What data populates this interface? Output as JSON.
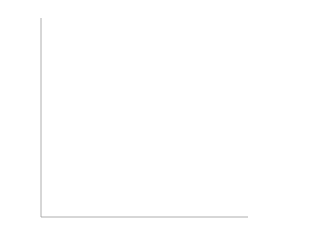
{
  "chart_data": [
    {
      "type": "bar",
      "orientation": "horizontal",
      "title": "",
      "xlabel": "",
      "ylabel": "",
      "xlim": [
        0,
        120
      ],
      "x_ticks": [
        0,
        10,
        20,
        30,
        40,
        50,
        60,
        70,
        80,
        90,
        100,
        110,
        120
      ],
      "grid": false,
      "categories": [
        "33FF33",
        "99CC00",
        "CCFF33",
        "00CC00",
        "0099FF",
        "33CCFF",
        "FFCC66",
        "006600",
        "FFCCCC",
        "33FF00",
        "CCFF00",
        "FFCC00",
        "FF0033",
        "339900",
        "00FF33",
        "FF3333",
        "00CCFF",
        "009900",
        "66FF00",
        "99FF33",
        "33CC00",
        "00FF00",
        "66CC00",
        "99FF00",
        "FF9900",
        "FF6600",
        "FF0000",
        "FF3300",
        "FFFF33",
        "FFFF00"
      ],
      "values": [
        11,
        12,
        12,
        13,
        14,
        15,
        15,
        16,
        16,
        17,
        17,
        17,
        18,
        18,
        19,
        19,
        19,
        20,
        20,
        21,
        22,
        23,
        23,
        24,
        28,
        28,
        28,
        30,
        31,
        79
      ],
      "bar_grays": [
        "#9a9a9a",
        "#9c9c9c",
        "#b4b4b4",
        "#8c8c8c",
        "#6e6e6e",
        "#a8a8a8",
        "#b8b8b8",
        "#3a3a3a",
        "#cfcfcf",
        "#a0a0a0",
        "#bcbcbc",
        "#b0b0b0",
        "#404040",
        "#6a6a6a",
        "#929292",
        "#5a5a5a",
        "#8a8a8a",
        "#6c6c6c",
        "#aaaaaa",
        "#b6b6b6",
        "#909090",
        "#9e9e9e",
        "#8e8e8e",
        "#a6a6a6",
        "#707070",
        "#5c5c5c",
        "#3e3e3e",
        "#4a4a4a",
        "#e4e4e4",
        "#e0e0e0"
      ]
    },
    {
      "type": "pie",
      "title": "",
      "legend_position": "right",
      "labels": [
        "79",
        "31",
        "30",
        "28",
        "28",
        "28",
        "24",
        "23",
        "23",
        "22"
      ],
      "values": [
        79,
        31,
        30,
        28,
        28,
        28,
        24,
        23,
        23,
        22
      ],
      "colors": [
        "#e0e0e0",
        "#e4e4e4",
        "#4a4a4a",
        "#3e3e3e",
        "#5c5c5c",
        "#707070",
        "#a6a6a6",
        "#8e8e8e",
        "#9e9e9e",
        "#909090"
      ]
    }
  ]
}
